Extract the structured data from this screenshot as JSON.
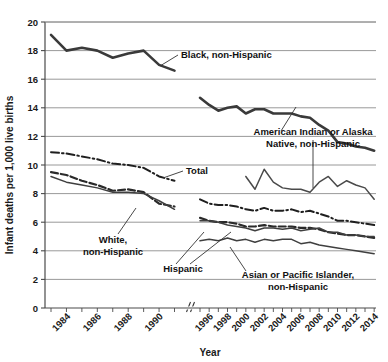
{
  "chart_data": {
    "type": "line",
    "title": "",
    "xlabel": "Year",
    "ylabel": "Infant deaths per 1,000 live births",
    "ylim": [
      0,
      20
    ],
    "ytick_step": 2,
    "ytick_labels": [
      "0",
      "2",
      "4",
      "6",
      "8",
      "10",
      "12",
      "14",
      "16",
      "18",
      "20"
    ],
    "xtick_labels": [
      "1984",
      "1986",
      "1988",
      "1990",
      "1996",
      "1998",
      "2000",
      "2002",
      "2004",
      "2006",
      "2008",
      "2010",
      "2012",
      "2014"
    ],
    "x_axis_break": true,
    "x_break_between": [
      "1991",
      "1995"
    ],
    "grid": "horizontal",
    "legend": "inline-annotations",
    "x_segment_1": [
      1983,
      1984,
      1985,
      1986,
      1987,
      1988,
      1989,
      1990,
      1991
    ],
    "x_segment_2": [
      1995,
      1996,
      1997,
      1998,
      1999,
      2000,
      2001,
      2002,
      2003,
      2004,
      2005,
      2006,
      2007,
      2008,
      2009,
      2010,
      2011,
      2012,
      2013,
      2014
    ],
    "series": [
      {
        "name": "Black, non-Hispanic",
        "style": "solid-thick",
        "color": "#3a3a3a",
        "seg1": [
          19.1,
          18.0,
          18.2,
          18.0,
          17.5,
          17.8,
          18.0,
          17.0,
          16.6
        ],
        "seg2": [
          14.7,
          14.2,
          13.8,
          14.0,
          14.1,
          13.6,
          13.9,
          13.9,
          13.6,
          13.6,
          13.6,
          13.4,
          13.3,
          12.8,
          12.4,
          11.6,
          11.5,
          11.3,
          11.2,
          11.0
        ]
      },
      {
        "name": "American Indian or Alaska Native, non-Hispanic",
        "style": "solid-thin",
        "color": "#4a4a4a",
        "seg1": [
          null,
          null,
          null,
          null,
          null,
          null,
          null,
          null,
          null
        ],
        "seg2": [
          null,
          null,
          null,
          null,
          null,
          9.2,
          8.3,
          9.7,
          8.8,
          8.4,
          8.3,
          8.3,
          8.1,
          8.8,
          9.2,
          8.5,
          8.9,
          8.6,
          8.4,
          7.6
        ]
      },
      {
        "name": "Total",
        "style": "dash-dot",
        "color": "#1f1f1f",
        "seg1": [
          10.9,
          10.8,
          10.6,
          10.4,
          10.1,
          10.0,
          9.8,
          9.2,
          8.9
        ],
        "seg2": [
          7.6,
          7.3,
          7.2,
          7.2,
          7.1,
          6.9,
          6.8,
          7.0,
          6.8,
          6.8,
          6.9,
          6.7,
          6.8,
          6.6,
          6.4,
          6.1,
          6.1,
          6.0,
          5.9,
          5.8
        ]
      },
      {
        "name": "White, non-Hispanic",
        "style": "dashed",
        "color": "#2a2a2a",
        "seg1": [
          9.5,
          9.3,
          8.9,
          8.6,
          8.2,
          8.3,
          8.1,
          7.3,
          7.1
        ],
        "seg2": [
          6.3,
          6.1,
          6.0,
          6.0,
          5.9,
          5.7,
          5.7,
          5.8,
          5.7,
          5.7,
          5.7,
          5.6,
          5.6,
          5.5,
          5.3,
          5.2,
          5.1,
          5.1,
          5.0,
          4.9
        ]
      },
      {
        "name": "Hispanic",
        "style": "solid-thin",
        "color": "#3f3f3f",
        "seg1": [
          9.2,
          8.8,
          8.6,
          8.4,
          8.1,
          8.1,
          8.0,
          7.5,
          6.9
        ],
        "seg2": [
          6.1,
          6.1,
          6.0,
          5.8,
          5.7,
          5.6,
          5.4,
          5.6,
          5.6,
          5.5,
          5.6,
          5.4,
          5.5,
          5.6,
          5.3,
          5.3,
          5.1,
          5.1,
          5.0,
          5.0
        ]
      },
      {
        "name": "Asian or Pacific Islander, non-Hispanic",
        "style": "solid-thin",
        "color": "#3f3f3f",
        "seg1": [
          null,
          null,
          null,
          null,
          null,
          null,
          null,
          null,
          null
        ],
        "seg2": [
          4.7,
          4.8,
          4.7,
          4.9,
          4.7,
          4.8,
          4.6,
          4.8,
          4.7,
          4.8,
          4.8,
          4.5,
          4.6,
          4.4,
          4.3,
          4.2,
          4.1,
          4.0,
          3.9,
          3.8
        ]
      }
    ],
    "annotations": [
      {
        "id": "black",
        "label_line_1": "Black, non-Hispanic",
        "label_line_2": ""
      },
      {
        "id": "aian",
        "label_line_1": "American Indian or Alaska",
        "label_line_2": "Native, non-Hispanic"
      },
      {
        "id": "total",
        "label_line_1": "Total",
        "label_line_2": ""
      },
      {
        "id": "white",
        "label_line_1": "White,",
        "label_line_2": "non-Hispanic"
      },
      {
        "id": "hispanic",
        "label_line_1": "Hispanic",
        "label_line_2": ""
      },
      {
        "id": "api",
        "label_line_1": "Asian or Pacific Islander,",
        "label_line_2": "non-Hispanic"
      }
    ]
  },
  "colors": {
    "grid": "#8d8d8d",
    "axis": "#4a4a4a",
    "text": "#111111",
    "background": "#ffffff"
  }
}
